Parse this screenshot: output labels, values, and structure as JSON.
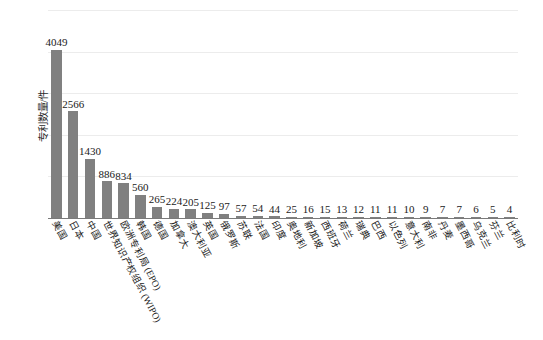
{
  "chart_data": {
    "type": "bar",
    "title": "",
    "subtitle": "",
    "xlabel": "",
    "ylabel": "专利数量/件",
    "ylim": [
      0,
      5000
    ],
    "yticks": [
      0,
      1000,
      2000,
      3000,
      4000,
      5000
    ],
    "ytick_labels": [
      "0",
      "1000",
      "2000",
      "3000",
      "4000",
      "5000"
    ],
    "grid": true,
    "legend": "none",
    "bar_color": "#808080",
    "gridline_color": "#ececec",
    "axis_color": "#7a7a7a",
    "value_labels_shown": true,
    "categories": [
      "美国",
      "日本",
      "中国",
      "世界知识产权组织 (WIPO)",
      "欧洲专利局 (EPO)",
      "韩国",
      "德国",
      "加拿大",
      "澳大利亚",
      "英国",
      "俄罗斯",
      "苏联",
      "法国",
      "印度",
      "奥地利",
      "新加坡",
      "西班牙",
      "荷兰",
      "瑞典",
      "巴西",
      "以色列",
      "意大利",
      "南非",
      "丹麦",
      "墨西哥",
      "乌克兰",
      "芬兰",
      "比利时"
    ],
    "values": [
      4049,
      2566,
      1430,
      886,
      834,
      560,
      265,
      224,
      205,
      125,
      97,
      57,
      54,
      44,
      25,
      16,
      15,
      13,
      12,
      11,
      11,
      10,
      9,
      7,
      7,
      6,
      5,
      4
    ],
    "value_label_texts": [
      "4049",
      "2566",
      "1430",
      "886",
      "834",
      "560",
      "265",
      "224",
      "205",
      "125",
      "97",
      "57",
      "54",
      "44",
      "25",
      "16",
      "15",
      "13",
      "12",
      "11",
      "11",
      "10",
      "9",
      "7",
      "7",
      "6",
      "5",
      "4"
    ]
  }
}
